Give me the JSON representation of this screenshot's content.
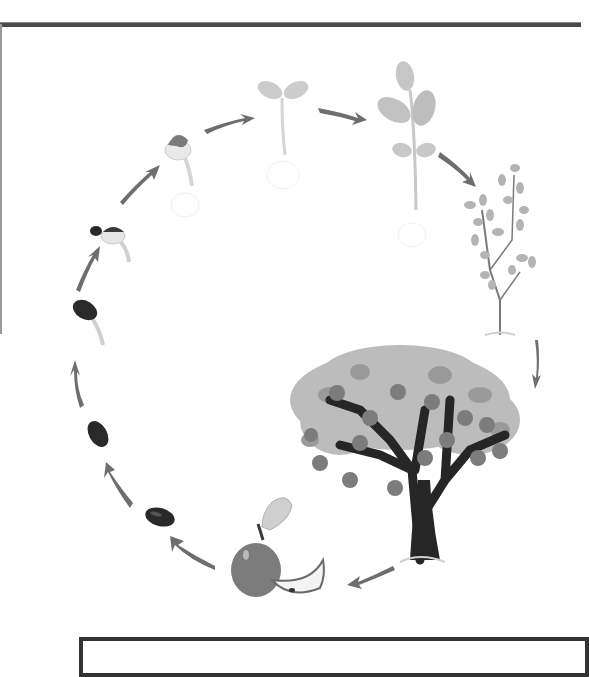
{
  "diagram": {
    "title": "",
    "colors": {
      "frame": "#4a4a4a",
      "arrow": "#6e6e6e",
      "seed": "#2a2a2a",
      "leaf_light": "#c9c9c9",
      "leaf_mid": "#a8a8a8",
      "trunk": "#262626",
      "apple": "#7c7c7c"
    },
    "stages": [
      {
        "id": "seed",
        "label": "seed"
      },
      {
        "id": "seed-2",
        "label": "seed"
      },
      {
        "id": "germinating-seed",
        "label": "germinating seed"
      },
      {
        "id": "sprouting-seed",
        "label": "sprout with root"
      },
      {
        "id": "seed-coat-sprout",
        "label": "sprout with seed coat"
      },
      {
        "id": "seedling",
        "label": "seedling"
      },
      {
        "id": "young-plant",
        "label": "young plant"
      },
      {
        "id": "sapling",
        "label": "sapling"
      },
      {
        "id": "fruiting-tree",
        "label": "mature apple tree"
      },
      {
        "id": "apple-fruit",
        "label": "apple"
      }
    ],
    "arrow_count": 11,
    "answer_box": {
      "text": ""
    }
  }
}
